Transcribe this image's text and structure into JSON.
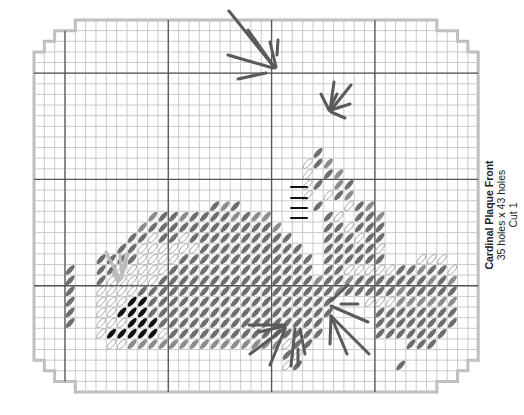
{
  "caption": {
    "title": "Cardinal Plaque Front",
    "size": "35 holes x 43 holes",
    "cut": "Cut 1"
  },
  "grid": {
    "cols": 43,
    "rows": 35,
    "left": 34,
    "top": 20,
    "cell_w": 10.33,
    "cell_h": 10.63,
    "major_cols": [
      3,
      13,
      23,
      33
    ],
    "major_rows": [
      5,
      15,
      25
    ],
    "corner_steps": [
      3,
      2,
      1,
      1
    ],
    "colors": {
      "minor_line": "#c4c4c4",
      "major_line": "#555555",
      "outline": "#bdbdbd"
    }
  },
  "stitch_colors": {
    "D": "#6e6e6e",
    "M": "#8c8c8c",
    "L": "#ffffff",
    "K": "#111111"
  },
  "stitch_rows": [
    {
      "row": 12,
      "cells": "...........................D..............."
    },
    {
      "row": 13,
      "cells": "..........................LDM.............."
    },
    {
      "row": 14,
      "cells": "..........................L.DM............."
    },
    {
      "row": 15,
      "cells": "..........................LD.MD............"
    },
    {
      "row": 16,
      "cells": "..........................L.LDM............"
    },
    {
      "row": 17,
      "cells": ".................DMD.......D..LDM..........."
    },
    {
      "row": 18,
      "cells": "...........MDDMDDDDMDMM.....DL.DDM.........."
    },
    {
      "row": 19,
      "cells": "..........MDDDDDDDDDDDDM....DDLDDD.........."
    },
    {
      "row": 20,
      "cells": ".........DDLDDLDDDDDDDDDD...DDDLDD.........."
    },
    {
      "row": 21,
      "cells": "........DDLLLLLLDDDDDDDDDD..DDDDDL.........."
    },
    {
      "row": 22,
      "cells": "......DDDDLLLLDDDDDDDDDDDDD.DDDDDD...LLL...."
    },
    {
      "row": 23,
      "cells": "...D..DDLLLLLDDDDDDDDDDDDDD.DDLLLLLDDMDDL..."
    },
    {
      "row": 24,
      "cells": "...D..DLLLLLDDDDDDDDDDDDDDDMDDMDDDDDDDMDM..."
    },
    {
      "row": 25,
      "cells": "...D..LLLLDDDDDDDDDDDDDDDDDDDMDDDDDMDDDDD..."
    },
    {
      "row": 26,
      "cells": "...D..LLLKKDDDDDDDDDDDDDDDDDD...LLLMMMMMM..."
    },
    {
      "row": 27,
      "cells": "...D..LLKKKDDDDDDDDDDDDDDDDDD....DDDDDDDD..."
    },
    {
      "row": 28,
      "cells": "...D..LLLKKKDDDDDDDDDDDDDDDD.....DDDDDDDD..."
    },
    {
      "row": 29,
      "cells": "......LKKKKKLDDDDDDDDDDDDDDD.....DDDDDDD...."
    },
    {
      "row": 30,
      "cells": ".......LLMMMMMMMMMMMMMMMLDD.........DDD....."
    },
    {
      "row": 31,
      "cells": "........................DL................."
    },
    {
      "row": 32,
      "cells": "........................LD.........D......."
    }
  ],
  "straight_stitches": [
    {
      "x1": 229,
      "y1": 11,
      "x2": 274,
      "y2": 67,
      "color": "#5a5a5a"
    },
    {
      "x1": 248,
      "y1": 30,
      "x2": 275,
      "y2": 68,
      "color": "#5a5a5a"
    },
    {
      "x1": 228,
      "y1": 55,
      "x2": 273,
      "y2": 68,
      "color": "#5a5a5a"
    },
    {
      "x1": 238,
      "y1": 79,
      "x2": 266,
      "y2": 73,
      "color": "#5a5a5a"
    },
    {
      "x1": 270,
      "y1": 42,
      "x2": 276,
      "y2": 67,
      "color": "#5a5a5a"
    },
    {
      "x1": 278,
      "y1": 40,
      "x2": 277,
      "y2": 55,
      "color": "#5a5a5a"
    },
    {
      "x1": 337,
      "y1": 94,
      "x2": 329,
      "y2": 110,
      "color": "#5a5a5a"
    },
    {
      "x1": 334,
      "y1": 82,
      "x2": 330,
      "y2": 110,
      "color": "#5a5a5a"
    },
    {
      "x1": 351,
      "y1": 85,
      "x2": 331,
      "y2": 110,
      "color": "#5a5a5a"
    },
    {
      "x1": 350,
      "y1": 104,
      "x2": 331,
      "y2": 110,
      "color": "#5a5a5a"
    },
    {
      "x1": 345,
      "y1": 118,
      "x2": 331,
      "y2": 112,
      "color": "#5a5a5a"
    },
    {
      "x1": 321,
      "y1": 94,
      "x2": 329,
      "y2": 110,
      "color": "#5a5a5a"
    },
    {
      "x1": 348,
      "y1": 285,
      "x2": 331,
      "y2": 301,
      "color": "#5a5a5a"
    },
    {
      "x1": 341,
      "y1": 304,
      "x2": 358,
      "y2": 304,
      "color": "#5a5a5a"
    },
    {
      "x1": 331,
      "y1": 306,
      "x2": 368,
      "y2": 322,
      "color": "#5a5a5a"
    },
    {
      "x1": 331,
      "y1": 316,
      "x2": 369,
      "y2": 354,
      "color": "#5a5a5a"
    },
    {
      "x1": 331,
      "y1": 316,
      "x2": 347,
      "y2": 354,
      "color": "#5a5a5a"
    },
    {
      "x1": 331,
      "y1": 316,
      "x2": 330,
      "y2": 344,
      "color": "#5a5a5a"
    },
    {
      "x1": 249,
      "y1": 325,
      "x2": 285,
      "y2": 325,
      "color": "#5a5a5a"
    },
    {
      "x1": 259,
      "y1": 332,
      "x2": 285,
      "y2": 326,
      "color": "#5a5a5a"
    },
    {
      "x1": 250,
      "y1": 354,
      "x2": 285,
      "y2": 328,
      "color": "#5a5a5a"
    },
    {
      "x1": 270,
      "y1": 365,
      "x2": 285,
      "y2": 329,
      "color": "#5a5a5a"
    },
    {
      "x1": 291,
      "y1": 366,
      "x2": 295,
      "y2": 329,
      "color": "#5a5a5a"
    },
    {
      "x1": 298,
      "y1": 365,
      "x2": 298,
      "y2": 349,
      "color": "#5a5a5a"
    },
    {
      "x1": 305,
      "y1": 354,
      "x2": 300,
      "y2": 329,
      "color": "#5a5a5a"
    },
    {
      "x1": 113,
      "y1": 272,
      "x2": 118,
      "y2": 282,
      "color": "#bbbbbb"
    },
    {
      "x1": 106,
      "y1": 252,
      "x2": 120,
      "y2": 280,
      "color": "#bbbbbb"
    },
    {
      "x1": 120,
      "y1": 255,
      "x2": 122,
      "y2": 278,
      "color": "#bbbbbb"
    },
    {
      "x1": 126,
      "y1": 254,
      "x2": 123,
      "y2": 273,
      "color": "#bbbbbb"
    },
    {
      "x1": 128,
      "y1": 254,
      "x2": 124,
      "y2": 268,
      "color": "#bbbbbb"
    },
    {
      "x1": 291,
      "y1": 187,
      "x2": 307,
      "y2": 187,
      "color": "#111111"
    },
    {
      "x1": 291,
      "y1": 198,
      "x2": 307,
      "y2": 198,
      "color": "#111111"
    },
    {
      "x1": 291,
      "y1": 208,
      "x2": 307,
      "y2": 208,
      "color": "#111111"
    },
    {
      "x1": 291,
      "y1": 218,
      "x2": 307,
      "y2": 218,
      "color": "#111111"
    }
  ]
}
